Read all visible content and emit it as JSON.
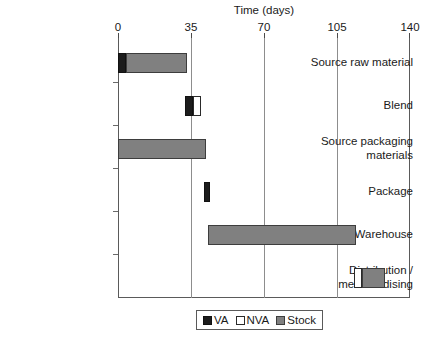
{
  "chart_data": {
    "type": "bar",
    "subtype": "stacked-horizontal-gantt",
    "title": "Time (days)",
    "xlabel": "Time (days)",
    "ylabel": "",
    "xlim": [
      0,
      140
    ],
    "xticks": [
      0,
      35,
      70,
      105,
      140
    ],
    "xtick_labels": [
      "0",
      "35",
      "70",
      "105",
      "140"
    ],
    "grid": "vertical-at-xticks",
    "legend_position": "bottom-center",
    "legend": [
      {
        "name": "VA",
        "color": "#1c1c1c"
      },
      {
        "name": "NVA",
        "color": "#ffffff"
      },
      {
        "name": "Stock",
        "color": "#808080"
      }
    ],
    "categories": [
      "Source raw material",
      "Blend",
      "Source packaging\nmaterials",
      "Package",
      "Warehouse",
      "Distribution /\nmerchandising"
    ],
    "bars": [
      {
        "category": "Source raw material",
        "segments": [
          {
            "series": "VA",
            "start": 0,
            "end": 4,
            "duration": 4
          },
          {
            "series": "Stock",
            "start": 4,
            "end": 33,
            "duration": 29
          }
        ]
      },
      {
        "category": "Blend",
        "segments": [
          {
            "series": "VA",
            "start": 32,
            "end": 36,
            "duration": 4
          },
          {
            "series": "NVA",
            "start": 36,
            "end": 40,
            "duration": 4
          }
        ]
      },
      {
        "category": "Source packaging materials",
        "segments": [
          {
            "series": "Stock",
            "start": 0,
            "end": 42,
            "duration": 42
          }
        ]
      },
      {
        "category": "Package",
        "segments": [
          {
            "series": "VA",
            "start": 41,
            "end": 44,
            "duration": 3
          }
        ]
      },
      {
        "category": "Warehouse",
        "segments": [
          {
            "series": "Stock",
            "start": 43,
            "end": 114,
            "duration": 71
          }
        ]
      },
      {
        "category": "Distribution / merchandising",
        "segments": [
          {
            "series": "NVA",
            "start": 113,
            "end": 117,
            "duration": 4
          },
          {
            "series": "Stock",
            "start": 117,
            "end": 128,
            "duration": 11
          }
        ]
      }
    ]
  },
  "chart": {
    "title": "Time (days)",
    "xticks": [
      {
        "label": "0"
      },
      {
        "label": "35"
      },
      {
        "label": "70"
      },
      {
        "label": "105"
      },
      {
        "label": "140"
      }
    ],
    "categories": [
      {
        "label": "Source raw material"
      },
      {
        "label": "Blend"
      },
      {
        "label": "Source packaging\nmaterials"
      },
      {
        "label": "Package"
      },
      {
        "label": "Warehouse"
      },
      {
        "label": "Distribution /\nmerchandising"
      }
    ],
    "legend": [
      {
        "label": "VA"
      },
      {
        "label": "NVA"
      },
      {
        "label": "Stock"
      }
    ]
  }
}
